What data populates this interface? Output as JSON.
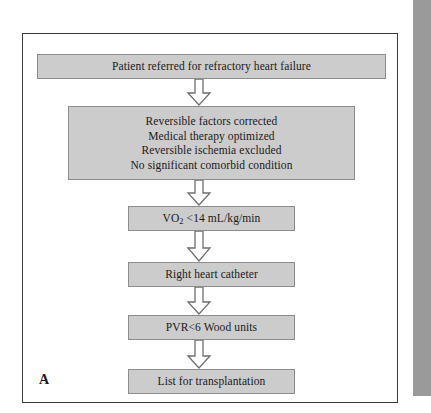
{
  "figure": {
    "panel_label": "A",
    "colors": {
      "box_fill": "#cccccc",
      "box_border": "#8d8d8d",
      "frame_border": "#3a3a3a",
      "arrow_fill": "#ffffff",
      "arrow_border": "#6f6f6f",
      "text": "#1a1a1a",
      "page_edge_band": "#9a9a9a"
    },
    "nodes": [
      {
        "id": "referral",
        "lines": [
          "Patient referred for refractory heart failure"
        ]
      },
      {
        "id": "criteria",
        "lines": [
          "Reversible factors corrected",
          "Medical therapy optimized",
          "Reversible ischemia excluded",
          "No significant comorbid condition"
        ]
      },
      {
        "id": "vo2",
        "lines": [
          "VO2 <14 mL/kg/min"
        ],
        "text_before_sub": "VO",
        "subscript": "2",
        "text_after_sub": " <14 mL/kg/min"
      },
      {
        "id": "right-heart-catheter",
        "lines": [
          "Right heart catheter"
        ]
      },
      {
        "id": "pvr",
        "lines": [
          "PVR<6 Wood units"
        ]
      },
      {
        "id": "list-transplant",
        "lines": [
          "List for transplantation"
        ]
      }
    ],
    "arrows": [
      {
        "from": "referral",
        "to": "criteria",
        "direction": "down"
      },
      {
        "from": "criteria",
        "to": "vo2",
        "direction": "down"
      },
      {
        "from": "vo2",
        "to": "right-heart-catheter",
        "direction": "down"
      },
      {
        "from": "right-heart-catheter",
        "to": "pvr",
        "direction": "down"
      },
      {
        "from": "pvr",
        "to": "list-transplant",
        "direction": "down"
      }
    ]
  }
}
